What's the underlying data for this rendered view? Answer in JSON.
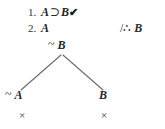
{
  "diagram": {
    "type": "truth-tree",
    "background_color": "#ffffff",
    "ink_color": "#2b2b2b",
    "premises": [
      {
        "number": "1.",
        "formula_antecedent": "A",
        "operator": "⊃",
        "formula_consequent": "B",
        "checkmark": "✔"
      },
      {
        "number": "2.",
        "formula": "A",
        "checkmark": ""
      }
    ],
    "conclusion": {
      "slash": "/",
      "therefore_symbol": "∴",
      "formula": "B"
    },
    "negated_conclusion": {
      "negation": "~",
      "formula": "B"
    },
    "branches": [
      {
        "side": "left",
        "negation": "~",
        "formula": "A",
        "closed_mark": "×",
        "closed": true
      },
      {
        "side": "right",
        "negation": "",
        "formula": "B",
        "closed_mark": "×",
        "closed": true
      }
    ]
  }
}
